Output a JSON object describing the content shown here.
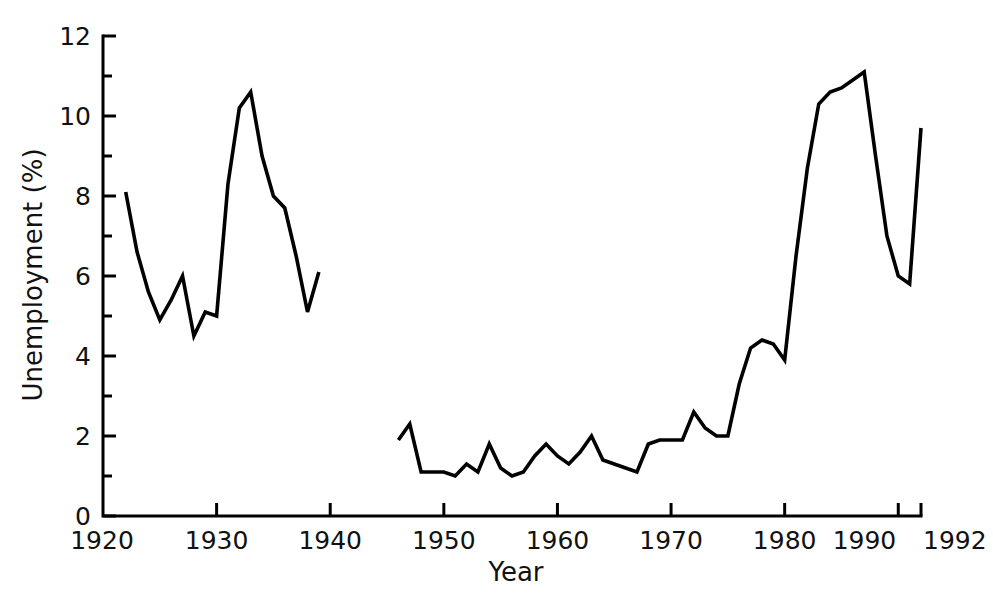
{
  "chart_data": {
    "type": "line",
    "title": "",
    "xlabel": "Year",
    "ylabel": "Unemployment (%)",
    "xlim": [
      1920,
      1992
    ],
    "ylim": [
      0,
      12
    ],
    "grid": false,
    "legend": "none",
    "x_ticks_major": [
      1920,
      1930,
      1940,
      1950,
      1960,
      1970,
      1980,
      1990,
      1992
    ],
    "x_tick_labels": [
      "1920",
      "1930",
      "1940",
      "1950",
      "1960",
      "1970",
      "1980",
      "1990",
      "1992"
    ],
    "y_ticks_major": [
      0,
      2,
      4,
      6,
      8,
      10,
      12
    ],
    "y_tick_labels": [
      "0",
      "2",
      "4",
      "6",
      "8",
      "10",
      "12"
    ],
    "y_ticks_minor": [
      1,
      3,
      5,
      7,
      9,
      11
    ],
    "line_color": "#000000",
    "series": [
      {
        "name": "Interwar period",
        "x": [
          1922,
          1923,
          1924,
          1925,
          1926,
          1927,
          1928,
          1929,
          1930,
          1931,
          1932,
          1933,
          1934,
          1935,
          1936,
          1937,
          1938,
          1939
        ],
        "values": [
          8.1,
          6.6,
          5.6,
          4.9,
          5.4,
          6.0,
          4.5,
          5.1,
          5.0,
          8.3,
          10.2,
          10.6,
          9.0,
          8.0,
          7.7,
          6.5,
          5.1,
          6.1
        ]
      },
      {
        "name": "Post-war period",
        "x": [
          1946,
          1947,
          1948,
          1949,
          1950,
          1951,
          1952,
          1953,
          1954,
          1955,
          1956,
          1957,
          1958,
          1959,
          1960,
          1961,
          1962,
          1963,
          1964,
          1965,
          1966,
          1967,
          1968,
          1969,
          1970,
          1971,
          1972,
          1973,
          1974,
          1975,
          1976,
          1977,
          1978,
          1979,
          1980,
          1981,
          1982,
          1983,
          1984,
          1985,
          1986,
          1987,
          1988,
          1989,
          1990,
          1991,
          1992
        ],
        "values": [
          1.9,
          2.3,
          1.1,
          1.1,
          1.1,
          1.0,
          1.3,
          1.1,
          1.8,
          1.2,
          1.0,
          1.1,
          1.5,
          1.8,
          1.5,
          1.3,
          1.6,
          2.0,
          1.4,
          1.3,
          1.2,
          1.1,
          1.8,
          1.9,
          1.9,
          1.9,
          2.6,
          2.2,
          2.0,
          2.0,
          3.3,
          4.2,
          4.4,
          4.3,
          3.9,
          6.5,
          8.7,
          10.3,
          10.6,
          10.7,
          10.9,
          11.1,
          9.0,
          7.0,
          6.0,
          5.8,
          9.7
        ]
      }
    ]
  }
}
